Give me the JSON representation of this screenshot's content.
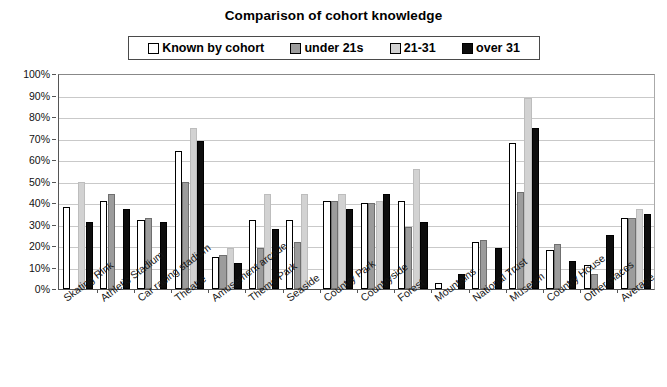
{
  "chart_data": {
    "type": "bar",
    "title": "Comparison of cohort knowledge",
    "xlabel": "",
    "ylabel": "",
    "ylim": [
      0,
      100
    ],
    "y_tick_labels": [
      "100%",
      "90%",
      "80%",
      "70%",
      "60%",
      "50%",
      "40%",
      "30%",
      "20%",
      "10%",
      "0%"
    ],
    "y_tick_values": [
      100,
      90,
      80,
      70,
      60,
      50,
      40,
      30,
      20,
      10,
      0
    ],
    "grid": true,
    "legend_position": "top",
    "categories": [
      "Skating Rink",
      "Athletic Stadium",
      "Car racing stadium",
      "Theatre",
      "Amusement arcade",
      "Theme Park",
      "Seaside",
      "Country Park",
      "Countryside",
      "Forest",
      "Mountains",
      "National Trust",
      "Museum",
      "Country House",
      "Other places",
      "Average"
    ],
    "series": [
      {
        "name": "Known by cohort",
        "color": "#ffffff",
        "values": [
          38,
          41,
          32,
          64,
          15,
          32,
          32,
          41,
          40,
          41,
          3,
          22,
          68,
          18,
          11,
          33
        ]
      },
      {
        "name": "under 21s",
        "color": "#9c9c9c",
        "values": [
          0,
          44,
          33,
          50,
          16,
          19,
          22,
          41,
          40,
          29,
          0,
          23,
          45,
          21,
          7,
          33
        ]
      },
      {
        "name": "21-31",
        "color": "#d2d2d2",
        "values": [
          50,
          0,
          0,
          75,
          19,
          44,
          44,
          44,
          41,
          56,
          0,
          0,
          89,
          0,
          0,
          37
        ]
      },
      {
        "name": "over 31",
        "color": "#0d0d0d",
        "values": [
          31,
          37,
          31,
          69,
          12,
          28,
          0,
          37,
          44,
          31,
          7,
          19,
          75,
          13,
          25,
          35
        ]
      }
    ]
  },
  "legend": {
    "items": [
      {
        "label": "Known by cohort",
        "swatch": "#ffffff"
      },
      {
        "label": "under 21s",
        "swatch": "#9c9c9c"
      },
      {
        "label": "21-31",
        "swatch": "#d2d2d2"
      },
      {
        "label": "over 31",
        "swatch": "#0d0d0d"
      }
    ]
  }
}
